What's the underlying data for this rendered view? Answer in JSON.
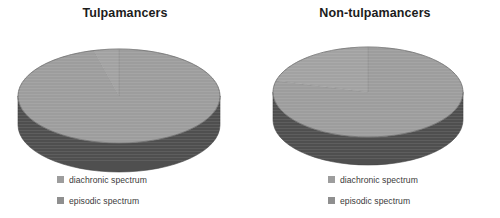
{
  "page": {
    "background": "#ffffff",
    "width": 500,
    "height": 218,
    "caption_partial": ""
  },
  "palette": {
    "slice_primary_top": "#9d9d9d",
    "slice_secondary_top": "#a2a2a2",
    "slice_primary_side": "#4d4d4d",
    "slice_secondary_side": "#585858",
    "divider": "#8a8a8a",
    "title_color": "#1c1c1c",
    "legend_text_color": "#3a3a3a",
    "legend_swatch_diachronic": "#9d9d9d",
    "legend_swatch_episodic": "#8f8f8f"
  },
  "panels": [
    {
      "id": "tulpamancers",
      "title": "Tulpamancers",
      "legend": [
        {
          "label": "diachronic spectrum",
          "color": "#9d9d9d"
        },
        {
          "label": "episodic spectrum",
          "color": "#8f8f8f"
        }
      ]
    },
    {
      "id": "non-tulpamancers",
      "title": "Non-tulpamancers",
      "legend": [
        {
          "label": "diachronic spectrum",
          "color": "#9d9d9d"
        },
        {
          "label": "episodic spectrum",
          "color": "#8f8f8f"
        }
      ]
    }
  ],
  "chart_data": [
    {
      "type": "pie",
      "title": "Tulpamancers",
      "three_d": true,
      "categories": [
        "diachronic spectrum",
        "episodic spectrum"
      ],
      "values": [
        96,
        4
      ],
      "unit": "percent",
      "legend_position": "bottom",
      "colors": [
        "#9d9d9d",
        "#a2a2a2"
      ],
      "labels_shown": false,
      "start_angle_deg": 270,
      "direction": "clockwise"
    },
    {
      "type": "pie",
      "title": "Non-tulpamancers",
      "three_d": true,
      "categories": [
        "diachronic spectrum",
        "episodic spectrum"
      ],
      "values": [
        79,
        21
      ],
      "unit": "percent",
      "legend_position": "bottom",
      "colors": [
        "#9d9d9d",
        "#a2a2a2"
      ],
      "labels_shown": false,
      "start_angle_deg": 270,
      "direction": "clockwise"
    }
  ]
}
